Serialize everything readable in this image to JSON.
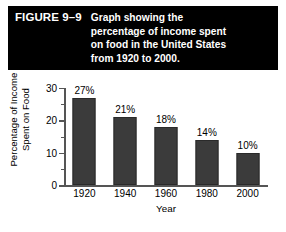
{
  "figure": {
    "number_label": "FIGURE 9–9",
    "caption_lines": [
      "Graph showing the",
      "percentage of income spent",
      "on food in the United States",
      "from 1920 to 2000."
    ],
    "caption_background": "#000000",
    "caption_text_color": "#ffffff"
  },
  "chart_data": {
    "type": "bar",
    "title": "",
    "subtitle": "",
    "categories": [
      "1920",
      "1940",
      "1960",
      "1980",
      "2000"
    ],
    "values": [
      27,
      21,
      18,
      14,
      10
    ],
    "data_labels": [
      "27%",
      "21%",
      "18%",
      "14%",
      "10%"
    ],
    "xlabel": "Year",
    "ylabel_lines": [
      "Percentage of Income",
      "Spent on Food"
    ],
    "ylim": [
      0,
      30
    ],
    "ytick_major": [
      0,
      10,
      20,
      30
    ],
    "ytick_major_labels": [
      "0",
      "10",
      "20",
      "30"
    ],
    "ytick_minor": [
      5,
      15,
      25
    ],
    "grid": false,
    "legend": false,
    "bar_color": "#3b3b3b",
    "axis_color": "#555555",
    "background": "#ffffff"
  }
}
